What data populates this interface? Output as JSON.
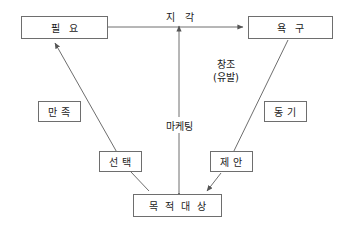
{
  "diagram": {
    "stroke_color": "#6e6e6e",
    "text_color": "#1a1a1a",
    "background_color": "#ffffff",
    "nodes": [
      {
        "id": "need",
        "label": "필  요"
      },
      {
        "id": "want",
        "label": "욕   구"
      },
      {
        "id": "satisfaction",
        "label": "만 족"
      },
      {
        "id": "motivation",
        "label": "동 기"
      },
      {
        "id": "choice",
        "label": "선 택"
      },
      {
        "id": "proposal",
        "label": "제 안"
      },
      {
        "id": "target",
        "label": "목 적 대 상"
      }
    ],
    "edge_labels": [
      {
        "id": "perception",
        "label": "지  각"
      },
      {
        "id": "marketing",
        "label": "마케팅"
      }
    ],
    "center_note": {
      "line1": "창조",
      "line2": "(유발)"
    }
  }
}
